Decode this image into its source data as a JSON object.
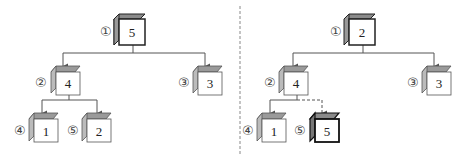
{
  "diagram": {
    "type": "heap-tree-comparison",
    "colors": {
      "line": "#555555",
      "cube_top": "#9a9a9a",
      "cube_side": "#b5b5b5",
      "cube_face": "#ffffff",
      "divider": "#888888"
    },
    "left_tree": {
      "nodes": [
        {
          "index": "①",
          "value": "5"
        },
        {
          "index": "②",
          "value": "4"
        },
        {
          "index": "③",
          "value": "3"
        },
        {
          "index": "④",
          "value": "1"
        },
        {
          "index": "⑤",
          "value": "2"
        }
      ]
    },
    "right_tree": {
      "nodes": [
        {
          "index": "①",
          "value": "2"
        },
        {
          "index": "②",
          "value": "4"
        },
        {
          "index": "③",
          "value": "3"
        },
        {
          "index": "④",
          "value": "1"
        },
        {
          "index": "⑤",
          "value": "5",
          "highlighted": true
        }
      ],
      "dashed_edge": "②→⑤"
    }
  }
}
